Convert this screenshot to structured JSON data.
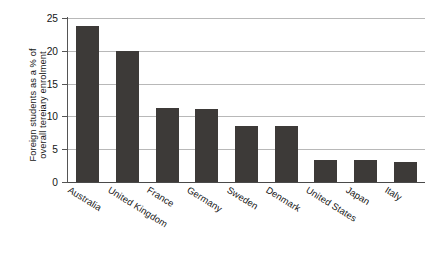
{
  "chart_data": {
    "type": "bar",
    "title": "",
    "subtitle": "",
    "xlabel": "",
    "ylabel": "Foreign students as a % of overall tereiary enrolment",
    "ylabel_lines": [
      "Foreign students as a % of",
      "overall tereiary enrolment"
    ],
    "categories": [
      "Australia",
      "United Kingdom",
      "France",
      "Germany",
      "Sweden",
      "Denmark",
      "United States",
      "Japan",
      "Italy"
    ],
    "values": [
      23.8,
      20.0,
      11.3,
      11.1,
      8.6,
      8.5,
      3.4,
      3.4,
      3.0
    ],
    "ylim": [
      0,
      25
    ],
    "yticks": [
      0,
      5,
      10,
      15,
      20,
      25
    ],
    "ytick_labels": [
      "0",
      "5",
      "10",
      "15",
      "20",
      "25"
    ],
    "grid": true,
    "grid_axis": "y",
    "legend": false,
    "legend_position": "none",
    "bar_color": "#3d3a38",
    "grid_color": "#b8b8b8",
    "axis_color": "#555555",
    "background_color": "#ffffff"
  }
}
